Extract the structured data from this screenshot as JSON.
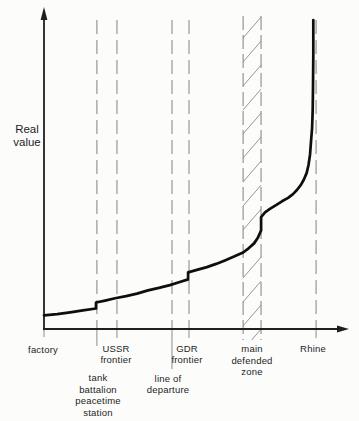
{
  "style": {
    "background": "#fcfcfb",
    "ink": "#1f1f1f",
    "curve": "#0e0e0e",
    "dash": "#8d8d8d",
    "hatch": "#8a8a8a"
  },
  "chart_data": {
    "type": "line",
    "title": "",
    "xlabel": "",
    "ylabel": "Real value",
    "ylabel_lines": [
      "Real",
      "value"
    ],
    "grid": false,
    "legend": false,
    "y_axis": {
      "type": "qualitative",
      "arrow": true,
      "range_rel": [
        0,
        1
      ]
    },
    "x_axis": {
      "type": "qualitative",
      "arrow": true,
      "landmarks": [
        {
          "id": "factory",
          "x_rel": 0.0,
          "label_lines": [
            "factory"
          ],
          "dashed_line": false
        },
        {
          "id": "tank-battalion-peacetime-station",
          "x_rel": 0.174,
          "label_lines": [
            "tank",
            "battalion",
            "peacetime",
            "station"
          ],
          "dashed_line": true,
          "value_step": true
        },
        {
          "id": "ussr-frontier",
          "x_rel": 0.24,
          "label_lines": [
            "USSR",
            "frontier"
          ],
          "dashed_line": true
        },
        {
          "id": "line-of-departure",
          "x_rel": 0.421,
          "label_lines": [
            "line of",
            "departure"
          ],
          "dashed_line": true
        },
        {
          "id": "gdr-frontier",
          "x_rel": 0.477,
          "label_lines": [
            "GDR",
            "frontier"
          ],
          "dashed_line": true,
          "value_step": true
        },
        {
          "id": "main-defended-zone",
          "x_rel": 0.684,
          "band_x_rel": [
            0.655,
            0.714
          ],
          "label_lines": [
            "main",
            "defended",
            "zone"
          ],
          "dashed_line": false,
          "value_step": true
        },
        {
          "id": "rhine",
          "x_rel": 0.895,
          "label_lines": [
            "Rhine"
          ],
          "dashed_line": true,
          "vertical_asymptote": true
        }
      ]
    },
    "shaded_band": {
      "label": "main defended zone",
      "x_rel": [
        0.655,
        0.714
      ],
      "style": "diagonal-hatch"
    },
    "series": [
      {
        "name": "real value",
        "points_rel_xy": [
          [
            0.0,
            0.043
          ],
          [
            0.043,
            0.047
          ],
          [
            0.086,
            0.053
          ],
          [
            0.128,
            0.059
          ],
          [
            0.171,
            0.065
          ],
          [
            0.171,
            0.084
          ],
          [
            0.201,
            0.09
          ],
          [
            0.234,
            0.097
          ],
          [
            0.27,
            0.104
          ],
          [
            0.306,
            0.112
          ],
          [
            0.342,
            0.122
          ],
          [
            0.378,
            0.13
          ],
          [
            0.414,
            0.139
          ],
          [
            0.444,
            0.148
          ],
          [
            0.474,
            0.157
          ],
          [
            0.474,
            0.179
          ],
          [
            0.503,
            0.187
          ],
          [
            0.536,
            0.196
          ],
          [
            0.566,
            0.206
          ],
          [
            0.595,
            0.217
          ],
          [
            0.625,
            0.229
          ],
          [
            0.655,
            0.242
          ],
          [
            0.674,
            0.256
          ],
          [
            0.691,
            0.271
          ],
          [
            0.704,
            0.29
          ],
          [
            0.712,
            0.307
          ],
          [
            0.714,
            0.312
          ],
          [
            0.714,
            0.354
          ],
          [
            0.727,
            0.369
          ],
          [
            0.743,
            0.38
          ],
          [
            0.763,
            0.392
          ],
          [
            0.783,
            0.404
          ],
          [
            0.803,
            0.415
          ],
          [
            0.819,
            0.427
          ],
          [
            0.832,
            0.44
          ],
          [
            0.845,
            0.456
          ],
          [
            0.855,
            0.473
          ],
          [
            0.864,
            0.494
          ],
          [
            0.87,
            0.519
          ],
          [
            0.875,
            0.551
          ],
          [
            0.878,
            0.589
          ],
          [
            0.882,
            0.636
          ],
          [
            0.884,
            0.693
          ],
          [
            0.885,
            0.763
          ],
          [
            0.886,
            0.867
          ],
          [
            0.886,
            0.978
          ]
        ]
      }
    ]
  }
}
